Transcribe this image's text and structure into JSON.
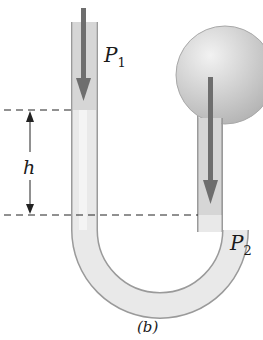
{
  "figure": {
    "caption": "(b)",
    "labels": {
      "p1": "P",
      "p1_sub": "1",
      "p2": "P",
      "p2_sub": "2",
      "height": "h"
    },
    "colors": {
      "tube_outline": "#9a9a9a",
      "tube_fill": "#e6e6e6",
      "fluid_fill": "#ececec",
      "gas_fill": "#d2d2d2",
      "bulb_fill": "#cfcfcf",
      "arrow": "#6e6e6e",
      "dashed_line": "#222222"
    }
  }
}
